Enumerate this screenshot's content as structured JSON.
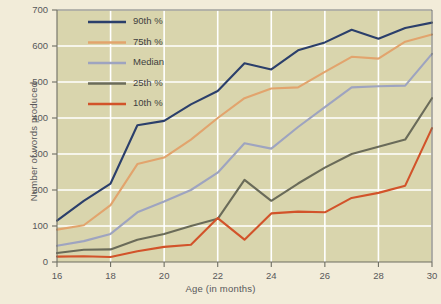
{
  "chart_data": {
    "type": "line",
    "title": "",
    "xlabel": "Age (in months)",
    "ylabel": "Number of words produced",
    "xlim": [
      16,
      30
    ],
    "ylim": [
      0,
      700
    ],
    "grid": true,
    "legend_position": "upper-left-inside",
    "xticks": [
      "16",
      "18",
      "20",
      "22",
      "24",
      "26",
      "28",
      "30"
    ],
    "yticks": [
      "0",
      "100",
      "200",
      "300",
      "400",
      "500",
      "600",
      "700"
    ],
    "x": [
      16,
      17,
      18,
      19,
      20,
      21,
      22,
      23,
      24,
      25,
      26,
      27,
      28,
      29,
      30
    ],
    "series": [
      {
        "name": "90th %",
        "color": "#2b3f6b",
        "values": [
          115,
          170,
          218,
          380,
          392,
          438,
          475,
          552,
          535,
          588,
          610,
          645,
          620,
          650,
          665
        ]
      },
      {
        "name": "75th %",
        "color": "#e2a46d",
        "values": [
          90,
          102,
          158,
          272,
          290,
          340,
          400,
          455,
          482,
          485,
          528,
          570,
          565,
          612,
          632
        ]
      },
      {
        "name": "Median",
        "color": "#9ea4c0",
        "values": [
          45,
          58,
          78,
          138,
          168,
          200,
          248,
          330,
          315,
          375,
          430,
          485,
          488,
          490,
          578
        ]
      },
      {
        "name": "25th %",
        "color": "#6a6b59",
        "values": [
          25,
          34,
          35,
          62,
          78,
          100,
          120,
          228,
          170,
          218,
          262,
          300,
          320,
          340,
          455
        ]
      },
      {
        "name": "10th %",
        "color": "#d2532a",
        "values": [
          15,
          16,
          14,
          30,
          42,
          48,
          122,
          62,
          135,
          140,
          138,
          178,
          192,
          212,
          372
        ]
      }
    ]
  },
  "style": {
    "plot_background": "#d9d5ad",
    "page_background": "#f2ecd9",
    "grid_color": "#ffffff",
    "axis_color": "#6e6e63",
    "tick_text_color": "#58585a"
  }
}
